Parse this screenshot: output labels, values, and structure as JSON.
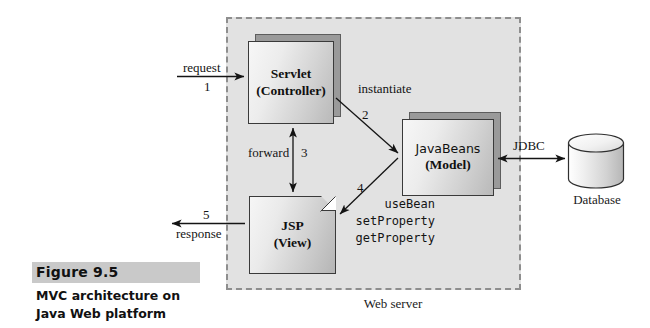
{
  "figure": {
    "number_label": "Figure 9.5",
    "caption": "MVC architecture on Java Web platform"
  },
  "region": {
    "web_server_label": "Web server"
  },
  "nodes": {
    "servlet": {
      "title": "Servlet",
      "subtitle": "(Controller)"
    },
    "javabeans": {
      "title": "JavaBeans",
      "subtitle": "(Model)"
    },
    "jsp": {
      "title": "JSP",
      "subtitle": "(View)"
    },
    "database": {
      "label": "Database"
    }
  },
  "edges": {
    "request": {
      "name": "request",
      "step": "1"
    },
    "response": {
      "name": "response",
      "step": "5"
    },
    "forward": {
      "name": "forward",
      "step": "3"
    },
    "instantiate": {
      "name": "instantiate",
      "step": "2"
    },
    "bean_access": {
      "step": "4",
      "calls": "useBean\nsetProperty\ngetProperty"
    },
    "jdbc": {
      "name": "JDBC"
    }
  },
  "colors": {
    "region_fill": "#e2e2e2",
    "region_border": "#8e8e8e",
    "box_border": "#3a3a3a",
    "box_shadow": "#9a9a9a",
    "caption_highlight": "#c9c9c9",
    "ink": "#141414"
  }
}
